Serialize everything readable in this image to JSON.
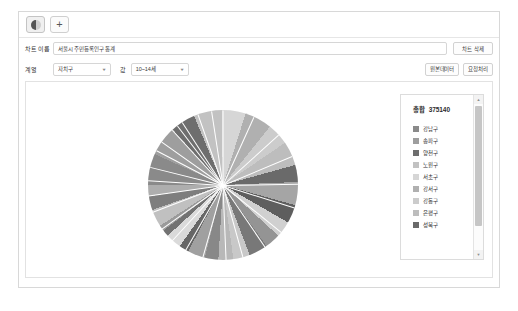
{
  "tabbar": {
    "chart_tab_icon": "pie-chart-icon",
    "add_tab_label": "+"
  },
  "form": {
    "chart_name_label": "차트 이름",
    "chart_name_value": "서울시 주민등록인구 통계",
    "delete_button": "차트 삭제",
    "category_label": "계열",
    "category_value": "자치구",
    "value_label": "값",
    "value_value": "10~14세",
    "source_button": "원본데이터",
    "request_button": "요청처리"
  },
  "legend": {
    "total_label": "총합",
    "total_value": "375140",
    "items": [
      {
        "label": "강남구",
        "color": "#8a8a8a"
      },
      {
        "label": "송파구",
        "color": "#9e9e9e"
      },
      {
        "label": "양천구",
        "color": "#6e6e6e"
      },
      {
        "label": "노원구",
        "color": "#c2c2c2"
      },
      {
        "label": "서초구",
        "color": "#d6d6d6"
      },
      {
        "label": "강서구",
        "color": "#b0b0b0"
      },
      {
        "label": "강동구",
        "color": "#cccccc"
      },
      {
        "label": "은평구",
        "color": "#bdbdbd"
      },
      {
        "label": "성북구",
        "color": "#6a6a6a"
      }
    ]
  },
  "chart_data": {
    "type": "pie",
    "title": "서울시 주민등록인구 통계",
    "xlabel": "자치구",
    "ylabel": "10~14세",
    "total": 375140,
    "legend_position": "right",
    "grid": false,
    "categories": [
      "강남구",
      "송파구",
      "양천구",
      "노원구",
      "서초구",
      "강서구",
      "강동구",
      "은평구",
      "성북구",
      "관악구",
      "구로구",
      "도봉구",
      "동대문구",
      "동작구",
      "마포구",
      "서대문구",
      "성동구",
      "영등포구",
      "용산구",
      "은평구2",
      "종로구",
      "중구",
      "중랑구",
      "강북구",
      "금천구"
    ],
    "values": [
      24800,
      23900,
      19800,
      22100,
      18900,
      21700,
      17200,
      19100,
      13400,
      18300,
      14600,
      12800,
      12200,
      14900,
      13100,
      11800,
      10600,
      13900,
      7800,
      12400,
      5200,
      4600,
      13700,
      10900,
      8900
    ],
    "colors": [
      "#8a8a8a",
      "#9e9e9e",
      "#6e6e6e",
      "#c2c2c2",
      "#d6d6d6",
      "#b0b0b0",
      "#cccccc",
      "#bdbdbd",
      "#6a6a6a",
      "#a5a5a5",
      "#5e5e5e",
      "#d0d0d0",
      "#949494",
      "#787878",
      "#c8c8c8",
      "#b8b8b8",
      "#888888",
      "#a0a0a0",
      "#666666",
      "#dadada",
      "#727272",
      "#9a9a9a",
      "#c0c0c0",
      "#7e7e7e",
      "#aeaeae"
    ]
  }
}
